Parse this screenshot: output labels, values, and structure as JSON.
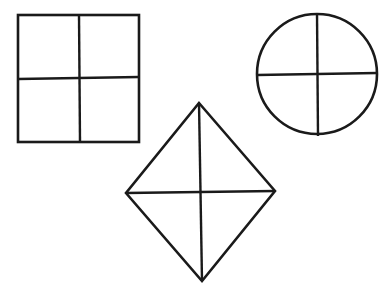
{
  "figure": {
    "background": "#ffffff",
    "stroke_color": "#1a1a1a",
    "shapes": [
      {
        "name": "square",
        "type": "rect",
        "x": 18,
        "y": 15,
        "width": 121,
        "height": 127,
        "divisions": 4,
        "dividers": [
          {
            "x1": 79,
            "y1": 15,
            "x2": 80,
            "y2": 142
          },
          {
            "x1": 18,
            "y1": 79,
            "x2": 139,
            "y2": 77
          }
        ]
      },
      {
        "name": "circle",
        "type": "circle",
        "cx": 317,
        "cy": 74,
        "r": 60,
        "divisions": 4,
        "dividers": [
          {
            "x1": 317,
            "y1": 13,
            "x2": 318,
            "y2": 136
          },
          {
            "x1": 257,
            "y1": 75,
            "x2": 377,
            "y2": 73
          }
        ]
      },
      {
        "name": "diamond",
        "type": "polygon",
        "points": "199,103 275,191 202,281 126,193",
        "divisions": 4,
        "dividers": [
          {
            "x1": 199,
            "y1": 103,
            "x2": 202,
            "y2": 281
          },
          {
            "x1": 126,
            "y1": 193,
            "x2": 275,
            "y2": 191
          }
        ]
      }
    ]
  }
}
